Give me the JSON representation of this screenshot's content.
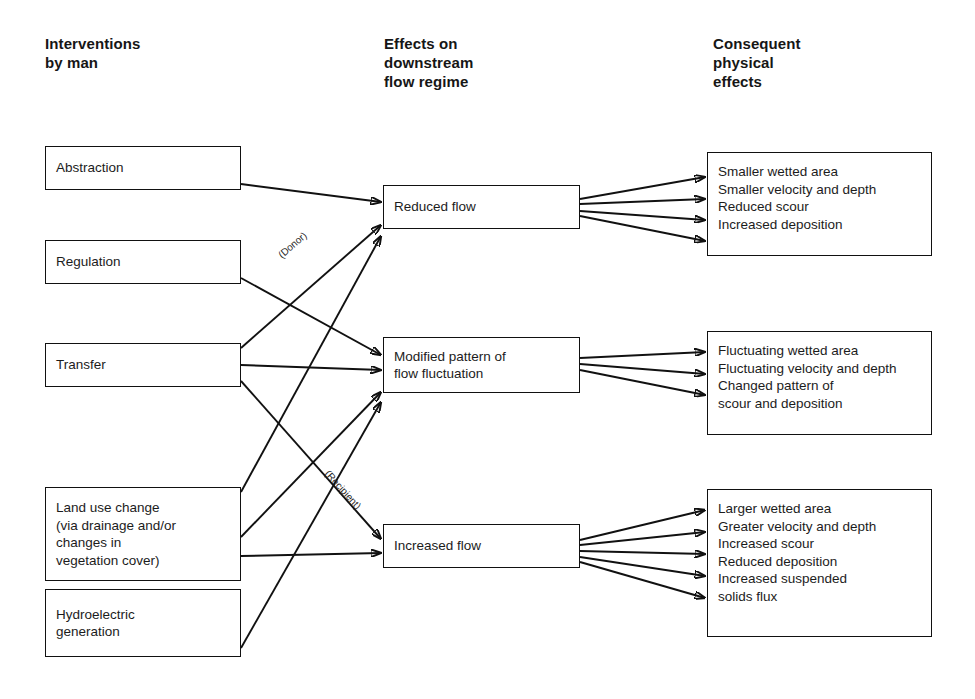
{
  "diagram": {
    "columns": [
      {
        "id": "interventions",
        "heading": "Interventions\nby man"
      },
      {
        "id": "effects",
        "heading": "Effects on\ndownstream\nflow regime"
      },
      {
        "id": "consequent",
        "heading": "Consequent\nphysical\neffects"
      }
    ],
    "interventions": [
      {
        "id": "abstraction",
        "label": "Abstraction"
      },
      {
        "id": "regulation",
        "label": "Regulation"
      },
      {
        "id": "transfer",
        "label": "Transfer"
      },
      {
        "id": "land-use-change",
        "label": "Land use change\n(via drainage and/or\nchanges in\nvegetation cover)"
      },
      {
        "id": "hydroelectric-generation",
        "label": "Hydroelectric\ngeneration"
      }
    ],
    "effects": [
      {
        "id": "reduced-flow",
        "label": "Reduced flow"
      },
      {
        "id": "modified-pattern",
        "label": "Modified pattern of\nflow fluctuation"
      },
      {
        "id": "increased-flow",
        "label": "Increased flow"
      }
    ],
    "consequences": [
      {
        "id": "consequences-reduced",
        "lines": [
          "Smaller wetted area",
          "Smaller velocity and depth",
          "Reduced scour",
          "Increased deposition"
        ]
      },
      {
        "id": "consequences-modified",
        "lines": [
          "Fluctuating wetted area",
          "Fluctuating velocity and depth",
          "Changed pattern of",
          "   scour and deposition"
        ]
      },
      {
        "id": "consequences-increased",
        "lines": [
          "Larger wetted area",
          "Greater velocity and depth",
          "Increased scour",
          "Reduced deposition",
          "Increased suspended",
          "   solids flux"
        ]
      }
    ],
    "edge_labels": [
      {
        "id": "donor",
        "text": "(Donor)"
      },
      {
        "id": "recipient",
        "text": "(Recipient)"
      }
    ],
    "colors": {
      "stroke": "#111111",
      "background": "#ffffff",
      "text": "#1c1c1c"
    }
  }
}
